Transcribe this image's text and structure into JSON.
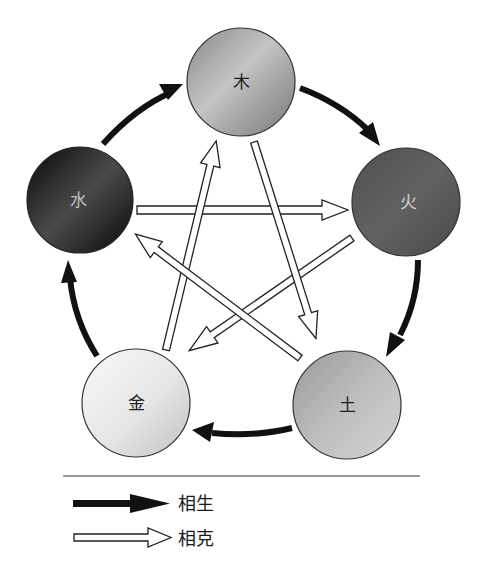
{
  "diagram": {
    "title": "",
    "elements": [
      {
        "id": "wood",
        "label": "木",
        "cx": 241,
        "cy": 82,
        "r": 54,
        "fill_light": "#c8c8c8",
        "fill_dark": "#7e7e7e",
        "text_color": "#222222"
      },
      {
        "id": "fire",
        "label": "火",
        "cx": 406,
        "cy": 202,
        "r": 54,
        "fill_light": "#6a6a6a",
        "fill_dark": "#4a4a4a",
        "text_color": "#d0d0d0"
      },
      {
        "id": "earth",
        "label": "土",
        "cx": 347,
        "cy": 405,
        "r": 54,
        "fill_light": "#cfcfcf",
        "fill_dark": "#8f8f8f",
        "text_color": "#222222"
      },
      {
        "id": "metal",
        "label": "金",
        "cx": 136,
        "cy": 403,
        "r": 54,
        "fill_light": "#f6f6f6",
        "fill_dark": "#cdcdcd",
        "text_color": "#222222"
      },
      {
        "id": "water",
        "label": "水",
        "cx": 80,
        "cy": 200,
        "r": 53,
        "fill_light": "#5a5a5a",
        "fill_dark": "#0c0c0c",
        "text_color": "#bdbdbd"
      }
    ],
    "generating_cycle": [
      {
        "from": "water",
        "to": "wood"
      },
      {
        "from": "wood",
        "to": "fire"
      },
      {
        "from": "fire",
        "to": "earth"
      },
      {
        "from": "earth",
        "to": "metal"
      },
      {
        "from": "metal",
        "to": "water"
      }
    ],
    "overcoming_cycle": [
      {
        "from": "water",
        "to": "fire"
      },
      {
        "from": "fire",
        "to": "metal"
      },
      {
        "from": "metal",
        "to": "wood"
      },
      {
        "from": "wood",
        "to": "earth"
      },
      {
        "from": "earth",
        "to": "water"
      }
    ],
    "colors": {
      "solid_arrow": "#111111",
      "hollow_arrow_stroke": "#222222",
      "hollow_arrow_fill": "#ffffff",
      "circle_stroke": "#333333",
      "divider": "#333333"
    }
  },
  "legend": {
    "items": [
      {
        "type": "solid",
        "label": "相生"
      },
      {
        "type": "hollow",
        "label": "相克"
      }
    ]
  }
}
